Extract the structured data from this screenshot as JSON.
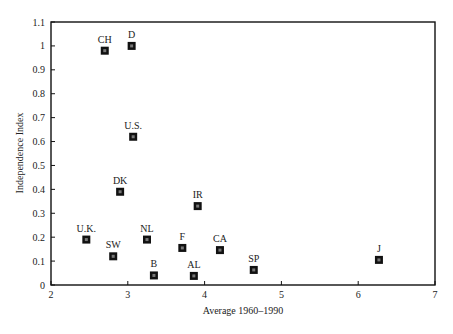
{
  "chart_data": {
    "type": "scatter",
    "title": "",
    "xlabel": "Average 1960–1990",
    "ylabel": "Independence Index",
    "xlim": [
      2,
      7
    ],
    "ylim": [
      0,
      1.1
    ],
    "grid": false,
    "legend": null,
    "x_ticks": [
      "2",
      "3",
      "4",
      "5",
      "6",
      "7"
    ],
    "y_ticks": [
      "0",
      "0.1",
      "0.2",
      "0.3",
      "0.4",
      "0.5",
      "0.6",
      "0.7",
      "0.8",
      "0.9",
      "1",
      "1.1"
    ],
    "points": [
      {
        "label": "CH",
        "x": 2.7,
        "y": 0.98
      },
      {
        "label": "D",
        "x": 3.05,
        "y": 1.0
      },
      {
        "label": "U.S.",
        "x": 3.07,
        "y": 0.62
      },
      {
        "label": "DK",
        "x": 2.9,
        "y": 0.39
      },
      {
        "label": "IR",
        "x": 3.91,
        "y": 0.33
      },
      {
        "label": "U.K.",
        "x": 2.46,
        "y": 0.19
      },
      {
        "label": "SW",
        "x": 2.81,
        "y": 0.12
      },
      {
        "label": "NL",
        "x": 3.25,
        "y": 0.19
      },
      {
        "label": "B",
        "x": 3.34,
        "y": 0.04
      },
      {
        "label": "F",
        "x": 3.71,
        "y": 0.155
      },
      {
        "label": "CA",
        "x": 4.2,
        "y": 0.146
      },
      {
        "label": "AL",
        "x": 3.86,
        "y": 0.038
      },
      {
        "label": "SP",
        "x": 4.64,
        "y": 0.063
      },
      {
        "label": "J",
        "x": 6.27,
        "y": 0.105
      }
    ]
  }
}
